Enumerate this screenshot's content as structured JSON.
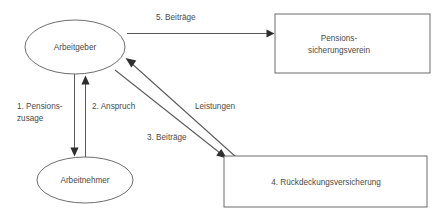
{
  "diagram": {
    "colors": {
      "background": "#ffffff",
      "stroke": "#5c5c5c",
      "connector": "#59595c",
      "text": "#4a4a4a",
      "arrowhead": "#2e2e30"
    },
    "nodes": [
      {
        "id": "arbeitgeber",
        "shape": "ellipse",
        "label": "Arbeitgeber",
        "lines": [
          "Arbeitgeber"
        ]
      },
      {
        "id": "arbeitnehmer",
        "shape": "ellipse",
        "label": "Arbeitnehmer",
        "lines": [
          "Arbeitnehmer"
        ]
      },
      {
        "id": "pensionssicherungsverein",
        "shape": "rectangle",
        "label": "Pensions-sicherungsverein",
        "lines": [
          "Pensions-",
          "sicherungsverein"
        ]
      },
      {
        "id": "rueckdeckungsversicherung",
        "shape": "rectangle",
        "label": "4. Rückdeckungsversicherung",
        "lines": [
          "4. Rückdeckungsversicherung"
        ]
      }
    ],
    "edges": [
      {
        "id": "pensionszusage",
        "label": "1. Pensions-zusage",
        "lines": [
          "1. Pensions-",
          "zusage"
        ],
        "from": "arbeitgeber",
        "to": "arbeitnehmer",
        "direction": "down"
      },
      {
        "id": "anspruch",
        "label": "2. Anspruch",
        "lines": [
          "2. Anspruch"
        ],
        "from": "arbeitnehmer",
        "to": "arbeitgeber",
        "direction": "up"
      },
      {
        "id": "beitraege-3",
        "label": "3. Beiträge",
        "lines": [
          "3. Beiträge"
        ],
        "from": "arbeitgeber",
        "to": "rueckdeckungsversicherung",
        "direction": "down-right"
      },
      {
        "id": "beitraege-5",
        "label": "5. Beiträge",
        "lines": [
          "5. Beiträge"
        ],
        "from": "arbeitgeber",
        "to": "pensionssicherungsverein",
        "direction": "right"
      },
      {
        "id": "leistungen",
        "label": "Leistungen",
        "lines": [
          "Leistungen"
        ],
        "from": "rueckdeckungsversicherung",
        "to": "arbeitgeber",
        "direction": "up-left"
      }
    ]
  }
}
